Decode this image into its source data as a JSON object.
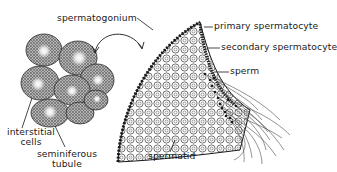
{
  "diagram": {
    "labels": {
      "spermatogonium": "spermatogonium",
      "primary_spermatocyte": "primary spermatocyte",
      "secondary_spermatocyte": "secondary spermatocyte",
      "sperm": "sperm",
      "spermatid": "spermatid",
      "interstitial_cells_line1": "interstitial",
      "interstitial_cells_line2": "cells",
      "seminiferous_tubule_line1": "seminiferous",
      "seminiferous_tubule_line2": "tubule"
    },
    "colors": {
      "ink": "#1a1a1a",
      "background": "#ffffff",
      "tubule_fill": "#8a8a8a",
      "lumen": "#f2f2f2"
    }
  }
}
